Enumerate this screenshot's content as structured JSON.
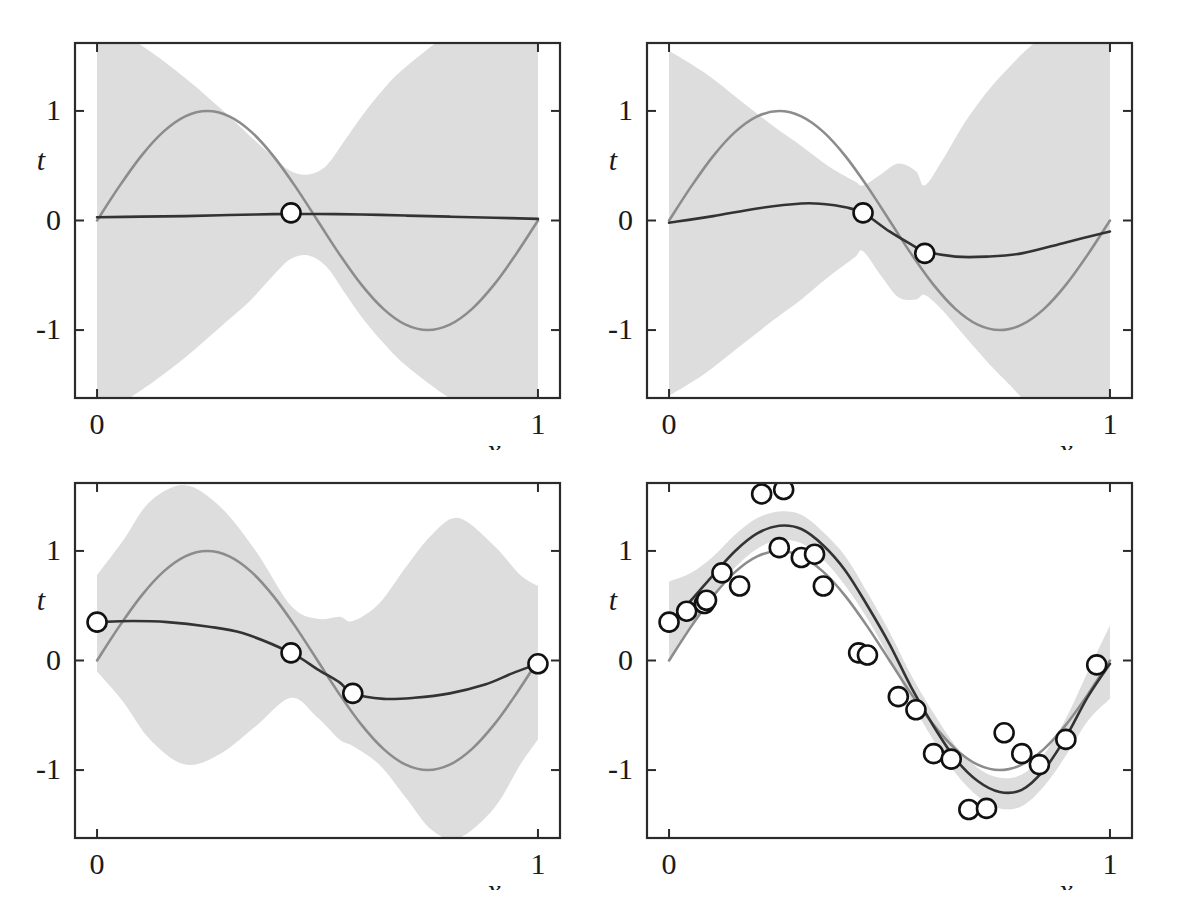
{
  "figure": {
    "title": "",
    "layout": "2x2 grid of regression panels",
    "background": "#ffffff"
  },
  "style": {
    "frame_color": "#2b2b2b",
    "true_curve_color": "#8c8c8c",
    "mean_curve_color": "#333333",
    "band_color": "#dddddd",
    "marker_edge_color": "#111111",
    "marker_face_color": "#ffffff",
    "tick_color": "#2b2b2b"
  },
  "axes": {
    "xlabel": "x",
    "ylabel": "t",
    "xticks": [
      "0",
      "1"
    ],
    "xtick_values": [
      0,
      1
    ],
    "yticks": [
      "1",
      "0",
      "-1"
    ],
    "ytick_values": [
      1,
      0,
      -1
    ],
    "xlim": [
      -0.05,
      1.05
    ],
    "ylim": [
      -1.6,
      1.6
    ],
    "grid": false
  },
  "chart_data": [
    {
      "id": "panel-1",
      "type": "line",
      "title": "",
      "xlabel": "x",
      "ylabel": "t",
      "xlim": [
        -0.05,
        1.05
      ],
      "ylim": [
        -1.6,
        1.6
      ],
      "grid": false,
      "legend": "none",
      "n_observations": 1,
      "series": [
        {
          "name": "true function sin(2*pi*x)",
          "color": "#8c8c8c",
          "x": [
            0,
            0.05,
            0.1,
            0.15,
            0.2,
            0.25,
            0.3,
            0.35,
            0.4,
            0.45,
            0.5,
            0.55,
            0.6,
            0.65,
            0.7,
            0.75,
            0.8,
            0.85,
            0.9,
            0.95,
            1
          ],
          "values": [
            0,
            0.309,
            0.588,
            0.809,
            0.951,
            1.0,
            0.951,
            0.809,
            0.588,
            0.309,
            0,
            -0.309,
            -0.588,
            -0.809,
            -0.951,
            -1.0,
            -0.951,
            -0.809,
            -0.588,
            -0.309,
            0
          ]
        },
        {
          "name": "predictive mean",
          "color": "#333333",
          "x": [
            0,
            0.1,
            0.2,
            0.3,
            0.4,
            0.5,
            0.6,
            0.7,
            0.8,
            0.9,
            1
          ],
          "values": [
            0.03,
            0.035,
            0.04,
            0.05,
            0.058,
            0.06,
            0.055,
            0.045,
            0.035,
            0.025,
            0.015
          ]
        }
      ],
      "band": {
        "name": "predictive +/- 1 std",
        "color": "#dddddd",
        "x": [
          0,
          0.1,
          0.2,
          0.3,
          0.35,
          0.4,
          0.44,
          0.48,
          0.52,
          0.56,
          0.6,
          0.65,
          0.7,
          0.8,
          0.9,
          1
        ],
        "upper": [
          1.85,
          1.6,
          1.3,
          0.95,
          0.76,
          0.58,
          0.45,
          0.42,
          0.5,
          0.72,
          0.95,
          1.2,
          1.4,
          1.7,
          1.95,
          2.1
        ],
        "lower": [
          -1.8,
          -1.55,
          -1.25,
          -0.9,
          -0.72,
          -0.5,
          -0.35,
          -0.32,
          -0.42,
          -0.65,
          -0.88,
          -1.12,
          -1.32,
          -1.62,
          -1.88,
          -2.05
        ]
      },
      "observations": {
        "x": [
          0.44
        ],
        "y": [
          0.07
        ]
      }
    },
    {
      "id": "panel-2",
      "type": "line",
      "title": "",
      "xlabel": "x",
      "ylabel": "t",
      "xlim": [
        -0.05,
        1.05
      ],
      "ylim": [
        -1.6,
        1.6
      ],
      "grid": false,
      "legend": "none",
      "n_observations": 2,
      "series": [
        {
          "name": "true function sin(2*pi*x)",
          "color": "#8c8c8c",
          "x": [
            0,
            0.05,
            0.1,
            0.15,
            0.2,
            0.25,
            0.3,
            0.35,
            0.4,
            0.45,
            0.5,
            0.55,
            0.6,
            0.65,
            0.7,
            0.75,
            0.8,
            0.85,
            0.9,
            0.95,
            1
          ],
          "values": [
            0,
            0.309,
            0.588,
            0.809,
            0.951,
            1.0,
            0.951,
            0.809,
            0.588,
            0.309,
            0,
            -0.309,
            -0.588,
            -0.809,
            -0.951,
            -1.0,
            -0.951,
            -0.809,
            -0.588,
            -0.309,
            0
          ]
        },
        {
          "name": "predictive mean",
          "color": "#333333",
          "x": [
            0,
            0.1,
            0.2,
            0.3,
            0.35,
            0.4,
            0.44,
            0.5,
            0.55,
            0.58,
            0.65,
            0.72,
            0.8,
            0.9,
            1
          ],
          "values": [
            -0.02,
            0.04,
            0.11,
            0.155,
            0.15,
            0.12,
            0.07,
            -0.1,
            -0.22,
            -0.28,
            -0.33,
            -0.33,
            -0.3,
            -0.2,
            -0.1
          ]
        }
      ],
      "band": {
        "name": "predictive +/- 1 std",
        "color": "#dddddd",
        "x": [
          0,
          0.08,
          0.16,
          0.24,
          0.3,
          0.36,
          0.42,
          0.44,
          0.48,
          0.52,
          0.56,
          0.58,
          0.62,
          0.68,
          0.76,
          0.86,
          1
        ],
        "upper": [
          1.55,
          1.35,
          1.1,
          0.85,
          0.68,
          0.5,
          0.36,
          0.32,
          0.42,
          0.52,
          0.45,
          0.32,
          0.55,
          0.95,
          1.35,
          1.7,
          2.0
        ],
        "lower": [
          -1.6,
          -1.4,
          -1.15,
          -0.9,
          -0.72,
          -0.52,
          -0.34,
          -0.28,
          -0.5,
          -0.7,
          -0.72,
          -0.68,
          -0.82,
          -1.1,
          -1.45,
          -1.8,
          -2.1
        ]
      },
      "observations": {
        "x": [
          0.44,
          0.58
        ],
        "y": [
          0.07,
          -0.3
        ]
      }
    },
    {
      "id": "panel-3",
      "type": "line",
      "title": "",
      "xlabel": "x",
      "ylabel": "t",
      "xlim": [
        -0.05,
        1.05
      ],
      "ylim": [
        -1.6,
        1.6
      ],
      "grid": false,
      "legend": "none",
      "n_observations": 4,
      "series": [
        {
          "name": "true function sin(2*pi*x)",
          "color": "#8c8c8c",
          "x": [
            0,
            0.05,
            0.1,
            0.15,
            0.2,
            0.25,
            0.3,
            0.35,
            0.4,
            0.45,
            0.5,
            0.55,
            0.6,
            0.65,
            0.7,
            0.75,
            0.8,
            0.85,
            0.9,
            0.95,
            1
          ],
          "values": [
            0,
            0.309,
            0.588,
            0.809,
            0.951,
            1.0,
            0.951,
            0.809,
            0.588,
            0.309,
            0,
            -0.309,
            -0.588,
            -0.809,
            -0.951,
            -1.0,
            -0.951,
            -0.809,
            -0.588,
            -0.309,
            0
          ]
        },
        {
          "name": "predictive mean",
          "color": "#333333",
          "x": [
            0,
            0.08,
            0.16,
            0.25,
            0.33,
            0.44,
            0.5,
            0.55,
            0.58,
            0.65,
            0.72,
            0.8,
            0.88,
            0.94,
            1
          ],
          "values": [
            0.35,
            0.36,
            0.35,
            0.31,
            0.25,
            0.07,
            -0.08,
            -0.2,
            -0.3,
            -0.35,
            -0.34,
            -0.3,
            -0.22,
            -0.12,
            -0.03
          ]
        }
      ],
      "band": {
        "name": "predictive +/- 1 std",
        "color": "#dddddd",
        "x": [
          0,
          0.06,
          0.12,
          0.2,
          0.28,
          0.36,
          0.44,
          0.5,
          0.55,
          0.58,
          0.64,
          0.7,
          0.76,
          0.82,
          0.9,
          0.96,
          1
        ],
        "upper": [
          0.78,
          1.1,
          1.45,
          1.6,
          1.4,
          1.0,
          0.5,
          0.38,
          0.4,
          0.36,
          0.52,
          0.85,
          1.15,
          1.3,
          1.05,
          0.78,
          0.68
        ],
        "lower": [
          -0.1,
          -0.38,
          -0.72,
          -0.95,
          -0.85,
          -0.6,
          -0.34,
          -0.52,
          -0.72,
          -0.78,
          -0.95,
          -1.25,
          -1.55,
          -1.62,
          -1.35,
          -0.95,
          -0.72
        ]
      },
      "observations": {
        "x": [
          0.0,
          0.44,
          0.58,
          1.0
        ],
        "y": [
          0.35,
          0.07,
          -0.3,
          -0.03
        ]
      }
    },
    {
      "id": "panel-4",
      "type": "line",
      "title": "",
      "xlabel": "x",
      "ylabel": "t",
      "xlim": [
        -0.05,
        1.05
      ],
      "ylim": [
        -1.6,
        1.6
      ],
      "grid": false,
      "legend": "none",
      "n_observations": 25,
      "series": [
        {
          "name": "true function sin(2*pi*x)",
          "color": "#8c8c8c",
          "x": [
            0,
            0.05,
            0.1,
            0.15,
            0.2,
            0.25,
            0.3,
            0.35,
            0.4,
            0.45,
            0.5,
            0.55,
            0.6,
            0.65,
            0.7,
            0.75,
            0.8,
            0.85,
            0.9,
            0.95,
            1
          ],
          "values": [
            0,
            0.309,
            0.588,
            0.809,
            0.951,
            1.0,
            0.951,
            0.809,
            0.588,
            0.309,
            0,
            -0.309,
            -0.588,
            -0.809,
            -0.951,
            -1.0,
            -0.951,
            -0.809,
            -0.588,
            -0.309,
            0
          ]
        },
        {
          "name": "predictive mean",
          "color": "#333333",
          "x": [
            0,
            0.05,
            0.1,
            0.15,
            0.2,
            0.25,
            0.3,
            0.35,
            0.4,
            0.45,
            0.5,
            0.55,
            0.6,
            0.65,
            0.7,
            0.75,
            0.8,
            0.85,
            0.9,
            0.95,
            1
          ],
          "values": [
            0.35,
            0.55,
            0.78,
            1.0,
            1.16,
            1.23,
            1.2,
            1.05,
            0.82,
            0.5,
            0.15,
            -0.25,
            -0.6,
            -0.9,
            -1.1,
            -1.2,
            -1.18,
            -1.0,
            -0.7,
            -0.33,
            -0.03
          ]
        }
      ],
      "band": {
        "name": "predictive +/- 1 std",
        "color": "#dddddd",
        "x": [
          0,
          0.05,
          0.1,
          0.15,
          0.2,
          0.25,
          0.3,
          0.35,
          0.4,
          0.45,
          0.5,
          0.55,
          0.6,
          0.65,
          0.7,
          0.75,
          0.8,
          0.85,
          0.9,
          0.95,
          1
        ],
        "upper": [
          0.72,
          0.8,
          0.95,
          1.15,
          1.3,
          1.36,
          1.33,
          1.17,
          0.95,
          0.62,
          0.26,
          -0.14,
          -0.48,
          -0.78,
          -0.98,
          -1.07,
          -1.04,
          -0.86,
          -0.53,
          -0.1,
          0.32
        ],
        "lower": [
          0.02,
          0.3,
          0.6,
          0.85,
          1.02,
          1.1,
          1.07,
          0.92,
          0.68,
          0.38,
          0.02,
          -0.38,
          -0.73,
          -1.03,
          -1.24,
          -1.35,
          -1.33,
          -1.15,
          -0.87,
          -0.55,
          -0.35
        ]
      },
      "observations": {
        "x": [
          0.0,
          0.04,
          0.08,
          0.085,
          0.12,
          0.16,
          0.21,
          0.25,
          0.26,
          0.3,
          0.33,
          0.35,
          0.43,
          0.45,
          0.52,
          0.56,
          0.6,
          0.64,
          0.68,
          0.72,
          0.76,
          0.8,
          0.84,
          0.9,
          0.97
        ],
        "y": [
          0.35,
          0.45,
          0.52,
          0.55,
          0.8,
          0.68,
          1.52,
          1.03,
          1.56,
          0.94,
          0.97,
          0.68,
          0.07,
          0.05,
          -0.33,
          -0.45,
          -0.85,
          -0.9,
          -1.36,
          -1.35,
          -0.66,
          -0.85,
          -0.95,
          -0.72,
          -0.04,
          -0.03
        ]
      }
    }
  ],
  "panels": [
    {
      "name": "panel-top-left",
      "ylabel": "t",
      "xlabel": "x",
      "x0": "0",
      "x1": "1",
      "y1": "1",
      "y0": "0",
      "ym1": "-1"
    },
    {
      "name": "panel-top-right",
      "ylabel": "t",
      "xlabel": "x",
      "x0": "0",
      "x1": "1",
      "y1": "1",
      "y0": "0",
      "ym1": "-1"
    },
    {
      "name": "panel-bottom-left",
      "ylabel": "t",
      "xlabel": "x",
      "x0": "0",
      "x1": "1",
      "y1": "1",
      "y0": "0",
      "ym1": "-1"
    },
    {
      "name": "panel-bottom-right",
      "ylabel": "t",
      "xlabel": "x",
      "x0": "0",
      "x1": "1",
      "y1": "1",
      "y0": "0",
      "ym1": "-1"
    }
  ]
}
